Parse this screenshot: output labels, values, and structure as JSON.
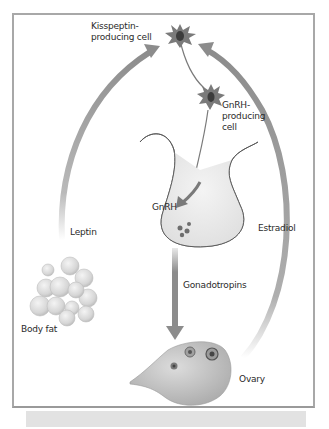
{
  "diagram": {
    "type": "hormonal-feedback-loop",
    "labels": {
      "kisspeptin_cell": "Kisspeptin-\nproducing cell",
      "gnrh_cell": "GnRH-\nproducing\ncell",
      "gnrh": "GnRH",
      "leptin": "Leptin",
      "estradiol": "Estradiol",
      "gonadotropins": "Gonadotropins",
      "body_fat": "Body fat",
      "ovary": "Ovary"
    },
    "nodes": [
      {
        "id": "kisspeptin-cell",
        "label": "Kisspeptin-producing cell"
      },
      {
        "id": "gnrh-cell",
        "label": "GnRH-producing cell"
      },
      {
        "id": "pituitary",
        "label": "GnRH"
      },
      {
        "id": "body-fat",
        "label": "Body fat"
      },
      {
        "id": "ovary",
        "label": "Ovary"
      }
    ],
    "edges": [
      {
        "from": "body-fat",
        "to": "kisspeptin-cell",
        "label": "Leptin"
      },
      {
        "from": "ovary",
        "to": "kisspeptin-cell",
        "label": "Estradiol"
      },
      {
        "from": "kisspeptin-cell",
        "to": "gnrh-cell",
        "label": ""
      },
      {
        "from": "gnrh-cell",
        "to": "pituitary",
        "label": "GnRH"
      },
      {
        "from": "pituitary",
        "to": "ovary",
        "label": "Gonadotropins"
      }
    ],
    "colors": {
      "arrow": "#8c8c8c",
      "cell_body": "#7a7a7a",
      "cell_nucleus": "#3c3c3c",
      "gland_fill": "#ececec",
      "frame": "#a8a8a8"
    }
  }
}
